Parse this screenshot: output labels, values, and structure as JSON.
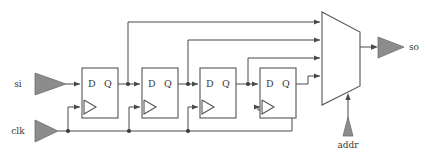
{
  "diagram": {
    "colors": {
      "wire": "#4a4a4a",
      "box_stroke": "#555555",
      "triangle_fill": "#8c8c8c",
      "triangle_stroke": "#6e6e6e",
      "junction_dot": "#3d3d3d",
      "background": "#ffffff",
      "text": "#3a3a3a"
    },
    "inputs": [
      {
        "name": "si",
        "label": "si",
        "role": "serial-in",
        "x": 28,
        "y": 84
      },
      {
        "name": "clk",
        "label": "clk",
        "role": "clock",
        "x": 22,
        "y": 134
      },
      {
        "name": "addr",
        "label": "addr",
        "role": "mux-select",
        "x": 348,
        "y": 147
      }
    ],
    "outputs": [
      {
        "name": "so",
        "label": "so",
        "role": "serial-out",
        "x": 405,
        "y": 47
      }
    ],
    "flipflops": [
      {
        "id": "ff1",
        "d_label": "D",
        "q_label": "Q",
        "x": 82,
        "y": 68,
        "w": 36,
        "h": 50
      },
      {
        "id": "ff2",
        "d_label": "D",
        "q_label": "Q",
        "x": 142,
        "y": 68,
        "w": 36,
        "h": 50
      },
      {
        "id": "ff3",
        "d_label": "D",
        "q_label": "Q",
        "x": 200,
        "y": 68,
        "w": 36,
        "h": 50
      },
      {
        "id": "ff4",
        "d_label": "D",
        "q_label": "Q",
        "x": 260,
        "y": 68,
        "w": 36,
        "h": 50
      }
    ],
    "mux": {
      "id": "mux4to1",
      "inputs": 4,
      "select_label": "addr",
      "x": 322,
      "y": 12,
      "width": 38,
      "height": 93
    },
    "nets": [
      {
        "name": "si-to-ff1-d",
        "from": "si",
        "to": "ff1.D"
      },
      {
        "name": "ff1-q-to-ff2-d",
        "from": "ff1.Q",
        "to": "ff2.D"
      },
      {
        "name": "ff2-q-to-ff3-d",
        "from": "ff2.Q",
        "to": "ff3.D"
      },
      {
        "name": "ff3-q-to-ff4-d",
        "from": "ff3.Q",
        "to": "ff4.D"
      },
      {
        "name": "ff1-q-to-mux-in0",
        "from": "ff1.Q",
        "to": "mux.in0"
      },
      {
        "name": "ff2-q-to-mux-in1",
        "from": "ff2.Q",
        "to": "mux.in1"
      },
      {
        "name": "ff3-q-to-mux-in2",
        "from": "ff3.Q",
        "to": "mux.in2"
      },
      {
        "name": "ff4-q-to-mux-in3",
        "from": "ff4.Q",
        "to": "mux.in3"
      },
      {
        "name": "clk-to-ff1",
        "from": "clk",
        "to": "ff1.clk"
      },
      {
        "name": "clk-to-ff2",
        "from": "clk",
        "to": "ff2.clk"
      },
      {
        "name": "clk-to-ff3",
        "from": "clk",
        "to": "ff3.clk"
      },
      {
        "name": "clk-to-ff4",
        "from": "clk",
        "to": "ff4.clk"
      },
      {
        "name": "addr-to-mux-select",
        "from": "addr",
        "to": "mux.select"
      },
      {
        "name": "mux-out-to-so",
        "from": "mux.out",
        "to": "so"
      }
    ],
    "labels": {
      "d": "D",
      "q": "Q",
      "si": "si",
      "clk": "clk",
      "so": "so",
      "addr": "addr"
    }
  }
}
